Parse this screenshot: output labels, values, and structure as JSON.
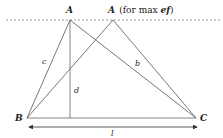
{
  "diagram": {
    "points": {
      "A": {
        "label": "A",
        "x": 70,
        "y": 20
      },
      "A_max": {
        "label": "A",
        "suffix": "(for max ",
        "suffix_bold": "ef",
        "suffix_end": ")",
        "x": 113,
        "y": 20
      },
      "B": {
        "label": "B",
        "x": 27,
        "y": 118
      },
      "C": {
        "label": "C",
        "x": 196,
        "y": 118
      },
      "D": {
        "x": 70,
        "y": 118
      }
    },
    "segments": {
      "c": "c",
      "b": "b",
      "d": "d",
      "l": "l"
    },
    "colors": {
      "line": "#555555",
      "dashed": "#999999",
      "text": "#222222"
    }
  }
}
